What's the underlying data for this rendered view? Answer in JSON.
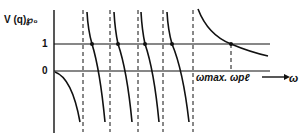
{
  "diagram": {
    "y_axis_label": "V (q)℘₀",
    "level_one_label": "1",
    "level_zero_label": "0",
    "omega_max_label": "ωmax.",
    "omega_pl_label": "ωpℓ",
    "x_axis_label": "ω",
    "colors": {
      "ink": "#111111",
      "background": "#ffffff"
    },
    "asymptotes_x_px": [
      83,
      110,
      138,
      163,
      193
    ],
    "omega_pl_x_px": 231
  }
}
